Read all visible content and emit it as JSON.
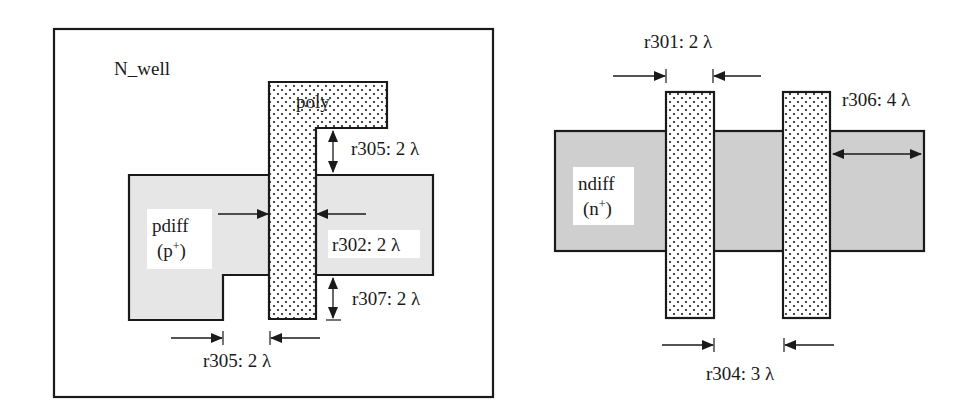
{
  "colors": {
    "pdiff_fill": "#e6e6e6",
    "ndiff_fill": "#cfcfcf",
    "poly_fill": "#ffffff",
    "poly_dots": "#1a1a1a",
    "outline": "#1a1a1a",
    "label_bg": "#ffffff"
  },
  "left_diagram": {
    "region_label": "N_well",
    "poly_label": "poly",
    "diff_label_line1": "pdiff",
    "diff_label_line2_base": "(p",
    "diff_label_line2_sup": "+",
    "diff_label_line2_close": ")",
    "rules": [
      {
        "id": "r305-top",
        "text": "r305: 2 λ"
      },
      {
        "id": "r302",
        "text": "r302: 2 λ"
      },
      {
        "id": "r307",
        "text": "r307: 2 λ"
      },
      {
        "id": "r305-bottom",
        "text": "r305: 2 λ"
      }
    ]
  },
  "right_diagram": {
    "diff_label_line1": "ndiff",
    "diff_label_line2_base": "(n",
    "diff_label_line2_sup": "+",
    "diff_label_line2_close": ")",
    "rules": [
      {
        "id": "r301",
        "text": "r301: 2 λ"
      },
      {
        "id": "r306",
        "text": "r306: 4 λ"
      },
      {
        "id": "r304",
        "text": "r304: 3 λ"
      }
    ]
  }
}
